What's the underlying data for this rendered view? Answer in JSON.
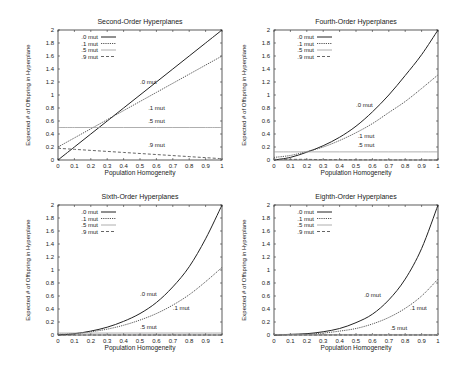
{
  "chart_data": [
    {
      "type": "line",
      "title": "Second-Order Hyperplanes",
      "xlabel": "Population Homogeneity",
      "ylabel": "Expected # of Offspring in Hyperplane",
      "xlim": [
        0,
        1
      ],
      "ylim": [
        0,
        2
      ],
      "xticks": [
        "0",
        "0.1",
        "0.2",
        "0.3",
        "0.4",
        "0.5",
        "0.6",
        "0.7",
        "0.8",
        "0.9",
        "1"
      ],
      "yticks": [
        "0",
        "0.2",
        "0.4",
        "0.6",
        "0.8",
        "1",
        "1.2",
        "1.4",
        "1.6",
        "1.8",
        "2"
      ],
      "legend_position": "upper-left",
      "x": [
        0,
        0.1,
        0.2,
        0.3,
        0.4,
        0.5,
        0.6,
        0.7,
        0.8,
        0.9,
        1
      ],
      "series": [
        {
          "name": ".0 mut",
          "style": "solid",
          "values": [
            0,
            0.2,
            0.4,
            0.6,
            0.8,
            1.0,
            1.2,
            1.4,
            1.6,
            1.8,
            2.0
          ]
        },
        {
          "name": ".1 mut",
          "style": "dotted",
          "values": [
            0.2,
            0.34,
            0.48,
            0.62,
            0.76,
            0.9,
            1.04,
            1.18,
            1.32,
            1.46,
            1.6
          ]
        },
        {
          "name": ".5 mut",
          "style": "light",
          "values": [
            0.5,
            0.5,
            0.5,
            0.5,
            0.5,
            0.5,
            0.5,
            0.5,
            0.5,
            0.5,
            0.5
          ]
        },
        {
          "name": ".9 mut",
          "style": "dashed",
          "values": [
            0.18,
            0.164,
            0.148,
            0.132,
            0.116,
            0.1,
            0.084,
            0.068,
            0.052,
            0.036,
            0.02
          ]
        }
      ],
      "annotations": [
        {
          "text": ".0 mut",
          "x": 0.5,
          "y": 1.17
        },
        {
          "text": ".1 mut",
          "x": 0.55,
          "y": 0.77
        },
        {
          "text": ".5 mut",
          "x": 0.55,
          "y": 0.57
        },
        {
          "text": ".9 mut",
          "x": 0.55,
          "y": 0.2
        }
      ]
    },
    {
      "type": "line",
      "title": "Fourth-Order Hyperplanes",
      "xlabel": "Population Homogeneity",
      "ylabel": "Expected # of Offspring in Hyperplane",
      "xlim": [
        0,
        1
      ],
      "ylim": [
        0,
        2
      ],
      "xticks": [
        "0",
        "0.1",
        "0.2",
        "0.3",
        "0.4",
        "0.5",
        "0.6",
        "0.7",
        "0.8",
        "0.9",
        "1"
      ],
      "yticks": [
        "0",
        "0.2",
        "0.4",
        "0.6",
        "0.8",
        "1",
        "1.2",
        "1.4",
        "1.6",
        "1.8",
        "2"
      ],
      "legend_position": "upper-left",
      "x": [
        0,
        0.1,
        0.2,
        0.3,
        0.4,
        0.5,
        0.6,
        0.7,
        0.8,
        0.9,
        1
      ],
      "series": [
        {
          "name": ".0 mut",
          "style": "solid",
          "values": [
            0,
            0.04,
            0.12,
            0.22,
            0.35,
            0.52,
            0.74,
            1.0,
            1.3,
            1.62,
            2.0
          ]
        },
        {
          "name": ".1 mut",
          "style": "dotted",
          "values": [
            0.04,
            0.07,
            0.13,
            0.2,
            0.3,
            0.42,
            0.56,
            0.73,
            0.9,
            1.1,
            1.31
          ]
        },
        {
          "name": ".5 mut",
          "style": "light",
          "values": [
            0.125,
            0.125,
            0.125,
            0.125,
            0.125,
            0.125,
            0.125,
            0.125,
            0.125,
            0.125,
            0.125
          ]
        },
        {
          "name": ".9 mut",
          "style": "dashed",
          "values": [
            0.01,
            0.01,
            0.01,
            0.005,
            0.005,
            0.003,
            0.002,
            0.001,
            0.001,
            0,
            0
          ]
        }
      ],
      "annotations": [
        {
          "text": ".0 mut",
          "x": 0.5,
          "y": 0.82
        },
        {
          "text": ".1 mut",
          "x": 0.51,
          "y": 0.34
        },
        {
          "text": ".5 mut",
          "x": 0.51,
          "y": 0.2
        }
      ]
    },
    {
      "type": "line",
      "title": "Sixth-Order Hyperplanes",
      "xlabel": "Population Homogeneity",
      "ylabel": "Expected # of Offspring in Hyperplane",
      "xlim": [
        0,
        1
      ],
      "ylim": [
        0,
        2
      ],
      "xticks": [
        "0",
        "0.1",
        "0.2",
        "0.3",
        "0.4",
        "0.5",
        "0.6",
        "0.7",
        "0.8",
        "0.9",
        "1"
      ],
      "yticks": [
        "0",
        "0.2",
        "0.4",
        "0.6",
        "0.8",
        "1",
        "1.2",
        "1.4",
        "1.6",
        "1.8",
        "2"
      ],
      "legend_position": "upper-left",
      "x": [
        0,
        0.1,
        0.2,
        0.3,
        0.4,
        0.5,
        0.6,
        0.7,
        0.8,
        0.9,
        1
      ],
      "series": [
        {
          "name": ".0 mut",
          "style": "solid",
          "values": [
            0,
            0.02,
            0.06,
            0.12,
            0.21,
            0.33,
            0.5,
            0.74,
            1.05,
            1.48,
            2.0
          ]
        },
        {
          "name": ".1 mut",
          "style": "dotted",
          "values": [
            0.01,
            0.02,
            0.05,
            0.09,
            0.15,
            0.23,
            0.33,
            0.46,
            0.62,
            0.82,
            1.04
          ]
        },
        {
          "name": ".5 mut",
          "style": "light",
          "values": [
            0.03,
            0.03,
            0.03,
            0.03,
            0.03,
            0.03,
            0.03,
            0.03,
            0.03,
            0.03,
            0.03
          ]
        },
        {
          "name": ".9 mut",
          "style": "dashed",
          "values": [
            0,
            0,
            0,
            0,
            0,
            0,
            0,
            0,
            0,
            0,
            0
          ]
        }
      ],
      "annotations": [
        {
          "text": ".0 mut",
          "x": 0.5,
          "y": 0.6
        },
        {
          "text": ".1 mut",
          "x": 0.7,
          "y": 0.39
        },
        {
          "text": ".5 mut",
          "x": 0.5,
          "y": 0.1
        }
      ]
    },
    {
      "type": "line",
      "title": "Eighth-Order Hyperplanes",
      "xlabel": "Population Homogeneity",
      "ylabel": "Expected # of Offspring in Hyperplane",
      "xlim": [
        0,
        1
      ],
      "ylim": [
        0,
        2
      ],
      "xticks": [
        "0",
        "0.1",
        "0.2",
        "0.3",
        "0.4",
        "0.5",
        "0.6",
        "0.7",
        "0.8",
        "0.9",
        "1"
      ],
      "yticks": [
        "0",
        "0.2",
        "0.4",
        "0.6",
        "0.8",
        "1",
        "1.2",
        "1.4",
        "1.6",
        "1.8",
        "2"
      ],
      "legend_position": "upper-left",
      "x": [
        0,
        0.1,
        0.2,
        0.3,
        0.4,
        0.5,
        0.6,
        0.7,
        0.8,
        0.9,
        1
      ],
      "series": [
        {
          "name": ".0 mut",
          "style": "solid",
          "values": [
            0,
            0.01,
            0.02,
            0.05,
            0.1,
            0.19,
            0.32,
            0.54,
            0.86,
            1.33,
            2.0
          ]
        },
        {
          "name": ".1 mut",
          "style": "dotted",
          "values": [
            0,
            0.005,
            0.015,
            0.03,
            0.06,
            0.1,
            0.17,
            0.27,
            0.41,
            0.6,
            0.86
          ]
        },
        {
          "name": ".5 mut",
          "style": "light",
          "values": [
            0.008,
            0.008,
            0.008,
            0.008,
            0.008,
            0.008,
            0.008,
            0.008,
            0.008,
            0.008,
            0.008
          ]
        },
        {
          "name": ".9 mut",
          "style": "dashed",
          "values": [
            0,
            0,
            0,
            0,
            0,
            0,
            0,
            0,
            0,
            0,
            0
          ]
        }
      ],
      "annotations": [
        {
          "text": ".0 mut",
          "x": 0.55,
          "y": 0.58
        },
        {
          "text": ".1 mut",
          "x": 0.83,
          "y": 0.38
        },
        {
          "text": ".5 mut",
          "x": 0.71,
          "y": 0.07
        }
      ]
    }
  ],
  "panels": [
    {
      "title": "Second-Order Hyperplanes",
      "xlabel": "Population Homogeneity",
      "ylabel": "Expected # of Offspring in Hyperplane"
    },
    {
      "title": "Fourth-Order Hyperplanes",
      "xlabel": "Population Homogeneity",
      "ylabel": "Expected # of Offspring in Hyperplane"
    },
    {
      "title": "Sixth-Order Hyperplanes",
      "xlabel": "Population Homogeneity",
      "ylabel": "Expected # of Offspring in Hyperplane"
    },
    {
      "title": "Eighth-Order Hyperplanes",
      "xlabel": "Population Homogeneity",
      "ylabel": "Expected # of Offspring in Hyperplane"
    }
  ],
  "colors": {
    "axis": "#333333",
    "solid": "#222222",
    "dotted": "#555555",
    "light": "#9a9a9a",
    "dashed": "#666666"
  }
}
